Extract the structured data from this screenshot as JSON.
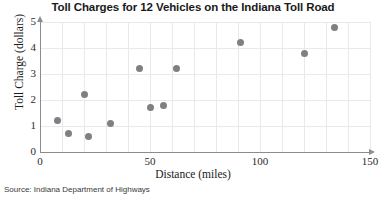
{
  "chart_data": {
    "type": "scatter",
    "title": "Toll Charges for 12 Vehicles on the Indiana Toll Road",
    "xlabel": "Distance (miles)",
    "ylabel": "Toll Charge (dollars)",
    "xlim": [
      0,
      150
    ],
    "ylim": [
      0,
      5
    ],
    "xticks": [
      0,
      50,
      100,
      150
    ],
    "yticks": [
      0,
      1,
      2,
      3,
      4,
      5
    ],
    "grid": true,
    "grid_x_step": 10,
    "grid_y_step": 1,
    "legend": "none",
    "marker_color": "#808084",
    "source": "Source: Indiana Department of Highways",
    "points": [
      {
        "x": 8,
        "y": 1.2
      },
      {
        "x": 13,
        "y": 0.7
      },
      {
        "x": 20,
        "y": 2.2
      },
      {
        "x": 22,
        "y": 0.6
      },
      {
        "x": 32,
        "y": 1.1
      },
      {
        "x": 45,
        "y": 3.2
      },
      {
        "x": 50,
        "y": 1.7
      },
      {
        "x": 56,
        "y": 1.8
      },
      {
        "x": 62,
        "y": 3.2
      },
      {
        "x": 91,
        "y": 4.2
      },
      {
        "x": 120,
        "y": 3.8
      },
      {
        "x": 134,
        "y": 4.8
      }
    ]
  },
  "axis_labels": {
    "y": [
      "0",
      "1",
      "2",
      "3",
      "4",
      "5"
    ],
    "x": [
      "0",
      "50",
      "100",
      "150"
    ]
  }
}
